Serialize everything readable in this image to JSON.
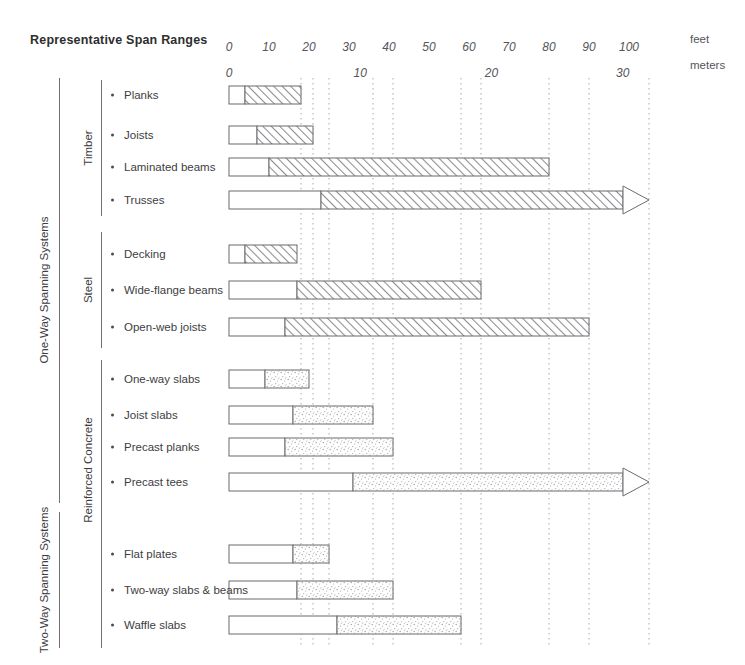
{
  "header": {
    "title": "Representative Span Ranges"
  },
  "axes": {
    "feet": {
      "unit_label": "feet",
      "ticks": [
        "0",
        "10",
        "20",
        "30",
        "40",
        "50",
        "60",
        "70",
        "80",
        "90",
        "100"
      ],
      "tick_values": [
        0,
        10,
        20,
        30,
        40,
        50,
        60,
        70,
        80,
        90,
        100
      ],
      "px_per_foot": 4,
      "origin_x": 229,
      "label_y": 40
    },
    "meters": {
      "unit_label": "meters",
      "ticks": [
        "0",
        "10",
        "20",
        "30"
      ],
      "tick_values": [
        0,
        10,
        20,
        30
      ],
      "feet_per_meter": 3.2808,
      "label_y": 66
    },
    "unit_x": 690
  },
  "groups": [
    {
      "label": "One-Way Spanning Systems",
      "name": "group-one-way",
      "rule_x": 59,
      "rule_top": 78,
      "rule_bottom": 503,
      "label_x": 44,
      "label_y": 290
    },
    {
      "label": "Two-Way Spanning Systems",
      "name": "group-two-way",
      "rule_x": 59,
      "rule_top": 512,
      "rule_bottom": 648,
      "label_x": 44,
      "label_y": 580
    }
  ],
  "materials": [
    {
      "label": "Timber",
      "name": "material-timber",
      "rule_x": 101,
      "rule_top": 80,
      "rule_bottom": 216,
      "label_x": 88,
      "label_y": 148
    },
    {
      "label": "Steel",
      "name": "material-steel",
      "rule_x": 101,
      "rule_top": 232,
      "rule_bottom": 348,
      "label_x": 88,
      "label_y": 290
    },
    {
      "label": "Reinforced Concrete",
      "name": "material-reinforced-concrete",
      "rule_x": 101,
      "rule_top": 360,
      "rule_bottom": 648,
      "label_x": 88,
      "label_y": 470
    }
  ],
  "chart_data": {
    "type": "bar",
    "title": "Representative Span Ranges",
    "xlabel": "feet / meters",
    "ylabel": "",
    "orientation": "horizontal",
    "xlim_feet": [
      0,
      100
    ],
    "grid": "dotted-vertical-at-bar-endpoints",
    "legend": "none",
    "categories": [
      "Planks",
      "Joists",
      "Laminated beams",
      "Trusses",
      "Decking",
      "Wide-flange beams",
      "Open-web joists",
      "One-way slabs",
      "Joist slabs",
      "Precast planks",
      "Precast tees",
      "Flat plates",
      "Two-way slabs & beams",
      "Waffle slabs"
    ],
    "series": [
      {
        "name": "Typical span range (feet)",
        "bars": [
          {
            "label": "Planks",
            "group": "Timber",
            "system": "One-Way Spanning Systems",
            "fill": "hatch",
            "y": 95,
            "start_ft": 4,
            "end_ft": 18,
            "arrow": false
          },
          {
            "label": "Joists",
            "group": "Timber",
            "system": "One-Way Spanning Systems",
            "fill": "hatch",
            "y": 135,
            "start_ft": 7,
            "end_ft": 21,
            "arrow": false
          },
          {
            "label": "Laminated beams",
            "group": "Timber",
            "system": "One-Way Spanning Systems",
            "fill": "hatch",
            "y": 167,
            "start_ft": 10,
            "end_ft": 80,
            "arrow": false
          },
          {
            "label": "Trusses",
            "group": "Timber",
            "system": "One-Way Spanning Systems",
            "fill": "hatch",
            "y": 200,
            "start_ft": 23,
            "end_ft": 105,
            "arrow": true
          },
          {
            "label": "Decking",
            "group": "Steel",
            "system": "One-Way Spanning Systems",
            "fill": "hatch",
            "y": 254,
            "start_ft": 4,
            "end_ft": 17,
            "arrow": false
          },
          {
            "label": "Wide-flange beams",
            "group": "Steel",
            "system": "One-Way Spanning Systems",
            "fill": "hatch",
            "y": 290,
            "start_ft": 17,
            "end_ft": 63,
            "arrow": false
          },
          {
            "label": "Open-web joists",
            "group": "Steel",
            "system": "One-Way Spanning Systems",
            "fill": "hatch",
            "y": 327,
            "start_ft": 14,
            "end_ft": 90,
            "arrow": false
          },
          {
            "label": "One-way slabs",
            "group": "Reinforced Concrete",
            "system": "One-Way Spanning Systems",
            "fill": "stipple",
            "y": 379,
            "start_ft": 9,
            "end_ft": 20,
            "arrow": false
          },
          {
            "label": "Joist slabs",
            "group": "Reinforced Concrete",
            "system": "One-Way Spanning Systems",
            "fill": "stipple",
            "y": 415,
            "start_ft": 16,
            "end_ft": 36,
            "arrow": false
          },
          {
            "label": "Precast planks",
            "group": "Reinforced Concrete",
            "system": "One-Way Spanning Systems",
            "fill": "stipple",
            "y": 447,
            "start_ft": 14,
            "end_ft": 41,
            "arrow": false
          },
          {
            "label": "Precast tees",
            "group": "Reinforced Concrete",
            "system": "One-Way Spanning Systems",
            "fill": "stipple",
            "y": 482,
            "start_ft": 31,
            "end_ft": 105,
            "arrow": true
          },
          {
            "label": "Flat plates",
            "group": "Reinforced Concrete",
            "system": "Two-Way Spanning Systems",
            "fill": "stipple",
            "y": 554,
            "start_ft": 16,
            "end_ft": 25,
            "arrow": false
          },
          {
            "label": "Two-way slabs & beams",
            "group": "Reinforced Concrete",
            "system": "Two-Way Spanning Systems",
            "fill": "stipple",
            "y": 590,
            "start_ft": 17,
            "end_ft": 41,
            "arrow": false
          },
          {
            "label": "Waffle slabs",
            "group": "Reinforced Concrete",
            "system": "Two-Way Spanning Systems",
            "fill": "stipple",
            "y": 625,
            "start_ft": 27,
            "end_ft": 58,
            "arrow": false
          }
        ]
      }
    ],
    "gridlines_ft": [
      18,
      21,
      25,
      36,
      41,
      58,
      63,
      80,
      90,
      105
    ]
  },
  "style": {
    "bar_height": 18,
    "bar_stroke": "#6b6b70",
    "hatch_color": "#8d8d92",
    "stipple_color": "#b6b6bb",
    "grid_color": "#a9a9ae",
    "rule_color": "#6f6f74",
    "text_color": "#3d3d42"
  }
}
